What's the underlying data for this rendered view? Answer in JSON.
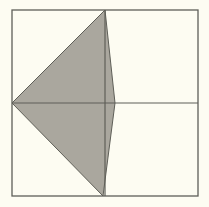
{
  "diagram": {
    "type": "geometry",
    "colors": {
      "background": "#fdfcf2",
      "stroke": "#5f5f58",
      "fill": "#aaa79e"
    },
    "square": {
      "x1": 12,
      "y1": 10,
      "x2": 198,
      "y2": 196
    },
    "midlines": {
      "vertical_x": 105,
      "horizontal_y": 103
    },
    "shaded_quadrilateral": {
      "points": [
        {
          "label": "left-mid",
          "x": 12,
          "y": 103
        },
        {
          "label": "top-mid",
          "x": 105,
          "y": 10
        },
        {
          "label": "right-of-center",
          "x": 115,
          "y": 103
        },
        {
          "label": "bottom-mid",
          "x": 103,
          "y": 196
        }
      ]
    }
  }
}
